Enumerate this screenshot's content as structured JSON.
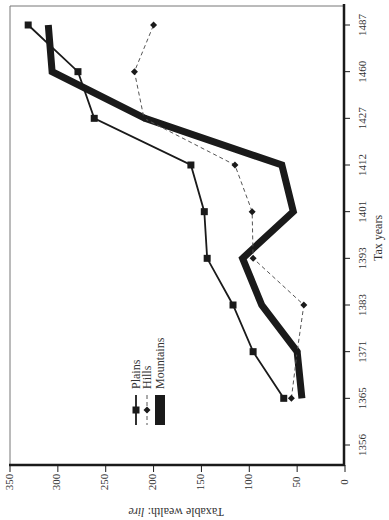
{
  "chart_data": {
    "type": "line",
    "orientation": "rotated-90-clockwise",
    "title": "",
    "xlabel": "Tax years",
    "ylabel": "Taxable wealth: lire",
    "ylabel_italic_part": "lire",
    "categories": [
      "1356",
      "1365",
      "1371",
      "1383",
      "1393",
      "1401",
      "1412",
      "1427",
      "1460",
      "1487"
    ],
    "ylim": [
      0,
      350
    ],
    "yticks": [
      0,
      50,
      100,
      150,
      200,
      250,
      300,
      350
    ],
    "grid": false,
    "legend_position": "inside-lower-left",
    "series": [
      {
        "name": "Plains",
        "style": "solid",
        "marker": "square",
        "values": [
          null,
          64,
          96,
          117,
          144,
          147,
          161,
          262,
          279,
          331
        ]
      },
      {
        "name": "Hills",
        "style": "dashed",
        "marker": "star",
        "values": [
          null,
          56,
          50,
          43,
          96,
          97,
          115,
          210,
          220,
          200
        ]
      },
      {
        "name": "Mountains",
        "style": "thick-solid",
        "marker": "none",
        "values": [
          null,
          45,
          50,
          87,
          107,
          54,
          66,
          209,
          306,
          310
        ]
      }
    ]
  },
  "axes": {
    "x_title": "Tax years",
    "y_title_prefix": "Taxable wealth: ",
    "y_title_italic": "lire"
  },
  "legend": {
    "items": [
      "Plains",
      "Hills",
      "Mountains"
    ]
  },
  "colors": {
    "line": "#1a1a1a",
    "dashed": "#555555",
    "frame": "#1a1a1a"
  }
}
